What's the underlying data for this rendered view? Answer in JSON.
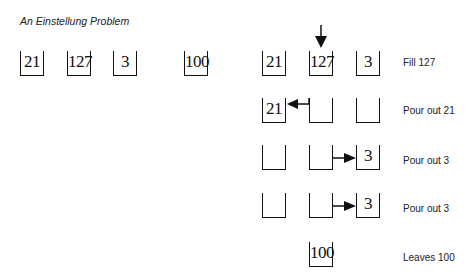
{
  "title": "An Einstellung Problem",
  "problem_jars": [
    {
      "label": "21"
    },
    {
      "label": "127"
    },
    {
      "label": "3"
    },
    {
      "label": "100"
    }
  ],
  "steps": [
    {
      "jars": [
        "21",
        "127",
        "3"
      ],
      "label": "Fill 127",
      "arrow": "down-into-127"
    },
    {
      "jars": [
        "21",
        "",
        ""
      ],
      "label": "Pour out 21",
      "arrow": "from-127-to-21"
    },
    {
      "jars": [
        "",
        "",
        "3"
      ],
      "label": "Pour out 3",
      "arrow": "from-127-to-3"
    },
    {
      "jars": [
        "",
        "",
        "3"
      ],
      "label": "Pour out 3",
      "arrow": "from-127-to-3"
    },
    {
      "jars": [
        "100"
      ],
      "label": "Leaves 100"
    }
  ]
}
